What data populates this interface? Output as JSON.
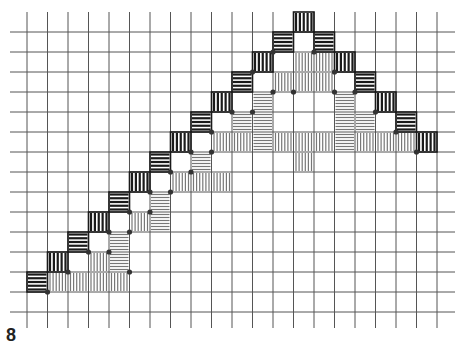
{
  "figure": {
    "label": "8"
  },
  "colors": {
    "background": "#ffffff",
    "grid_line": "#555555",
    "dark_hatch": "#1a1a1a",
    "light_hatch": "#777777",
    "dot": "#333333"
  },
  "grid": {
    "x0": 27,
    "dx": 20.5,
    "cols": 20,
    "y0": 32,
    "dy": 20,
    "rows": 14,
    "h_line_x_start": 10,
    "h_line_x_end": 455,
    "v_line_y_start": 12,
    "v_line_y_end": 328
  },
  "tiles": [
    {
      "c": 13,
      "r": -1,
      "type": "dark-v"
    },
    {
      "c": 12,
      "r": 0,
      "type": "dark-h"
    },
    {
      "c": 14,
      "r": 0,
      "type": "dark-h"
    },
    {
      "c": 11,
      "r": 1,
      "type": "dark-v"
    },
    {
      "c": 13,
      "r": 1,
      "type": "light-v"
    },
    {
      "c": 14,
      "r": 1,
      "type": "light-v"
    },
    {
      "c": 15,
      "r": 1,
      "type": "dark-v"
    },
    {
      "c": 10,
      "r": 2,
      "type": "dark-h"
    },
    {
      "c": 12,
      "r": 2,
      "type": "light-v"
    },
    {
      "c": 13,
      "r": 2,
      "type": "light-v"
    },
    {
      "c": 14,
      "r": 2,
      "type": "light-v"
    },
    {
      "c": 16,
      "r": 2,
      "type": "dark-h"
    },
    {
      "c": 9,
      "r": 3,
      "type": "dark-v"
    },
    {
      "c": 11,
      "r": 3,
      "type": "light-h"
    },
    {
      "c": 15,
      "r": 3,
      "type": "light-h"
    },
    {
      "c": 17,
      "r": 3,
      "type": "dark-v"
    },
    {
      "c": 8,
      "r": 4,
      "type": "dark-h"
    },
    {
      "c": 10,
      "r": 4,
      "type": "light-h"
    },
    {
      "c": 11,
      "r": 4,
      "type": "light-h"
    },
    {
      "c": 15,
      "r": 4,
      "type": "light-h"
    },
    {
      "c": 16,
      "r": 4,
      "type": "light-h"
    },
    {
      "c": 18,
      "r": 4,
      "type": "dark-h"
    },
    {
      "c": 7,
      "r": 5,
      "type": "dark-v"
    },
    {
      "c": 9,
      "r": 5,
      "type": "light-v"
    },
    {
      "c": 10,
      "r": 5,
      "type": "light-v"
    },
    {
      "c": 11,
      "r": 5,
      "type": "light-h"
    },
    {
      "c": 12,
      "r": 5,
      "type": "light-v"
    },
    {
      "c": 13,
      "r": 5,
      "type": "light-v"
    },
    {
      "c": 14,
      "r": 5,
      "type": "light-v"
    },
    {
      "c": 15,
      "r": 5,
      "type": "light-h"
    },
    {
      "c": 16,
      "r": 5,
      "type": "light-v"
    },
    {
      "c": 17,
      "r": 5,
      "type": "light-v"
    },
    {
      "c": 18,
      "r": 5,
      "type": "light-v"
    },
    {
      "c": 19,
      "r": 5,
      "type": "dark-v"
    },
    {
      "c": 13,
      "r": 6,
      "type": "light-v"
    },
    {
      "c": 6,
      "r": 6,
      "type": "dark-h"
    },
    {
      "c": 8,
      "r": 6,
      "type": "light-h"
    },
    {
      "c": 5,
      "r": 7,
      "type": "dark-v"
    },
    {
      "c": 7,
      "r": 7,
      "type": "light-v"
    },
    {
      "c": 8,
      "r": 7,
      "type": "light-v"
    },
    {
      "c": 9,
      "r": 7,
      "type": "light-v"
    },
    {
      "c": 4,
      "r": 8,
      "type": "dark-h"
    },
    {
      "c": 6,
      "r": 8,
      "type": "light-h"
    },
    {
      "c": 3,
      "r": 9,
      "type": "dark-v"
    },
    {
      "c": 5,
      "r": 9,
      "type": "light-v"
    },
    {
      "c": 6,
      "r": 9,
      "type": "light-h"
    },
    {
      "c": 2,
      "r": 10,
      "type": "dark-h"
    },
    {
      "c": 4,
      "r": 10,
      "type": "light-h"
    },
    {
      "c": 1,
      "r": 11,
      "type": "dark-v"
    },
    {
      "c": 3,
      "r": 11,
      "type": "light-v"
    },
    {
      "c": 4,
      "r": 11,
      "type": "light-h"
    },
    {
      "c": 0,
      "r": 12,
      "type": "dark-h"
    },
    {
      "c": 1,
      "r": 12,
      "type": "light-v"
    },
    {
      "c": 2,
      "r": 12,
      "type": "light-v"
    },
    {
      "c": 3,
      "r": 12,
      "type": "light-v"
    },
    {
      "c": 4,
      "r": 12,
      "type": "light-v"
    }
  ],
  "dots": [
    [
      12,
      1
    ],
    [
      14,
      1
    ],
    [
      11,
      2
    ],
    [
      12,
      3
    ],
    [
      13,
      3
    ],
    [
      15,
      2
    ],
    [
      15,
      3
    ],
    [
      16,
      3
    ],
    [
      10,
      4
    ],
    [
      11,
      4
    ],
    [
      17,
      4
    ],
    [
      9,
      5
    ],
    [
      18,
      5
    ],
    [
      19,
      6
    ],
    [
      8,
      6
    ],
    [
      9,
      6
    ],
    [
      7,
      7
    ],
    [
      8,
      7
    ],
    [
      6,
      8
    ],
    [
      7,
      8
    ],
    [
      5,
      9
    ],
    [
      6,
      9
    ],
    [
      4,
      10
    ],
    [
      5,
      10
    ],
    [
      3,
      11
    ],
    [
      4,
      11
    ],
    [
      2,
      12
    ],
    [
      1,
      13
    ],
    [
      5,
      12
    ]
  ]
}
